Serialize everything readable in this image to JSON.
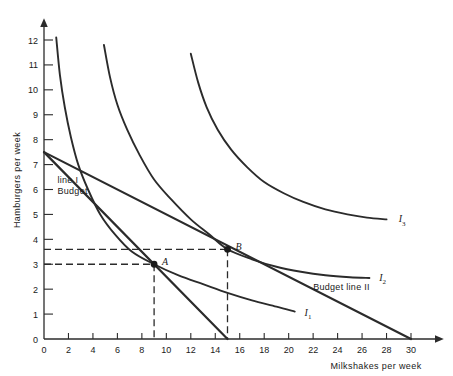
{
  "chart_data": {
    "type": "line",
    "title": "",
    "xlabel": "Milkshakes per week",
    "ylabel": "Hamburgers per week",
    "xlim": [
      0,
      30
    ],
    "ylim": [
      0,
      12
    ],
    "xticks": [
      0,
      2,
      4,
      6,
      8,
      10,
      12,
      14,
      16,
      18,
      20,
      22,
      24,
      26,
      28,
      30
    ],
    "yticks": [
      0,
      1,
      2,
      3,
      4,
      5,
      6,
      7,
      8,
      9,
      10,
      11,
      12
    ],
    "grid": false,
    "legend": "inline-curve-labels",
    "series": [
      {
        "name": "I1",
        "label": "I",
        "subscript": "1",
        "kind": "indifference-curve",
        "label_x": 21.3,
        "label_y": 1.05,
        "points": [
          [
            1.0,
            12.1
          ],
          [
            1.3,
            10.6
          ],
          [
            1.7,
            9.3
          ],
          [
            2.2,
            8.1
          ],
          [
            2.8,
            7.0
          ],
          [
            3.6,
            6.0
          ],
          [
            4.6,
            5.0
          ],
          [
            5.8,
            4.2
          ],
          [
            7.2,
            3.5
          ],
          [
            9.0,
            3.0
          ],
          [
            11.0,
            2.55
          ],
          [
            13.0,
            2.2
          ],
          [
            15.0,
            1.85
          ],
          [
            17.0,
            1.55
          ],
          [
            19.0,
            1.3
          ],
          [
            20.5,
            1.1
          ]
        ]
      },
      {
        "name": "I2",
        "label": "I",
        "subscript": "2",
        "kind": "indifference-curve",
        "label_x": 27.4,
        "label_y": 2.45,
        "points": [
          [
            4.9,
            11.8
          ],
          [
            5.4,
            10.5
          ],
          [
            6.0,
            9.4
          ],
          [
            6.8,
            8.4
          ],
          [
            7.8,
            7.4
          ],
          [
            9.0,
            6.4
          ],
          [
            10.4,
            5.6
          ],
          [
            12.0,
            4.8
          ],
          [
            13.5,
            4.2
          ],
          [
            15.0,
            3.6
          ],
          [
            17.0,
            3.2
          ],
          [
            19.0,
            2.9
          ],
          [
            21.0,
            2.7
          ],
          [
            23.0,
            2.56
          ],
          [
            25.0,
            2.48
          ],
          [
            26.6,
            2.45
          ]
        ]
      },
      {
        "name": "I3",
        "label": "I",
        "subscript": "3",
        "kind": "indifference-curve",
        "label_x": 29.0,
        "label_y": 4.8,
        "points": [
          [
            12.0,
            11.45
          ],
          [
            12.6,
            10.3
          ],
          [
            13.3,
            9.3
          ],
          [
            14.2,
            8.4
          ],
          [
            15.3,
            7.6
          ],
          [
            16.6,
            6.9
          ],
          [
            18.0,
            6.3
          ],
          [
            19.6,
            5.85
          ],
          [
            21.2,
            5.5
          ],
          [
            23.0,
            5.2
          ],
          [
            24.8,
            5.0
          ],
          [
            26.4,
            4.87
          ],
          [
            28.0,
            4.8
          ]
        ]
      }
    ],
    "budget_lines": [
      {
        "name": "Budget line I",
        "label": "Budget\nline I",
        "label_line1": "Budget",
        "label_line2": "line I",
        "y_intercept": 7.5,
        "x_intercept": 15.0,
        "label_x": 1.1,
        "label_y": 5.8
      },
      {
        "name": "Budget line II",
        "label": "Budget line II",
        "label_line1": "Budget line II",
        "y_intercept": 7.5,
        "x_intercept": 30.0,
        "label_x": 22.0,
        "label_y": 1.95
      }
    ],
    "points": [
      {
        "name": "A",
        "label": "A",
        "x": 9.0,
        "y": 3.0,
        "guides": {
          "horizontal": true,
          "vertical": true
        }
      },
      {
        "name": "B",
        "label": "B",
        "x": 15.0,
        "y": 3.6,
        "guides": {
          "horizontal": true,
          "vertical": true
        }
      }
    ],
    "annotations": []
  },
  "axis": {
    "x_label": "Milkshakes per week",
    "y_label": "Hamburgers per week",
    "x_tick_labels": [
      "0",
      "2",
      "4",
      "6",
      "8",
      "10",
      "12",
      "14",
      "16",
      "18",
      "20",
      "22",
      "24",
      "26",
      "28",
      "30"
    ],
    "y_tick_labels": [
      "0",
      "1",
      "2",
      "3",
      "4",
      "5",
      "6",
      "7",
      "8",
      "9",
      "10",
      "11",
      "12"
    ],
    "y_origin_label": "0"
  },
  "labels": {
    "curve_i1": "I",
    "curve_i1_sub": "1",
    "curve_i2": "I",
    "curve_i2_sub": "2",
    "curve_i3": "I",
    "curve_i3_sub": "3",
    "point_a": "A",
    "point_b": "B",
    "budget_i_line1": "Budget",
    "budget_i_line2": "line I",
    "budget_ii": "Budget line II"
  },
  "colors": {
    "ink": "#2b2b2b",
    "background": "#ffffff"
  }
}
